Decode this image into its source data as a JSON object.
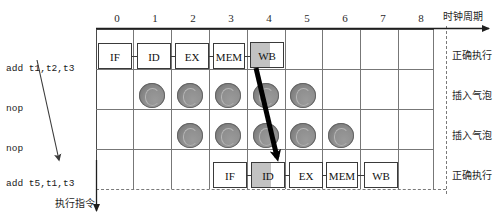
{
  "diagram": {
    "title_axis": "时钟周期",
    "bottom_axis": "执行指令",
    "cycles": [
      "0",
      "1",
      "2",
      "3",
      "4",
      "5",
      "6",
      "7",
      "8"
    ],
    "rows": [
      {
        "instruction": "add t1,t2,t3",
        "status": "正确执行",
        "kind": "stages",
        "stages": [
          {
            "label": "IF",
            "cycle": 0,
            "highlight": false
          },
          {
            "label": "ID",
            "cycle": 1,
            "highlight": false
          },
          {
            "label": "EX",
            "cycle": 2,
            "highlight": false
          },
          {
            "label": "MEM",
            "cycle": 3,
            "highlight": false
          },
          {
            "label": "WB",
            "cycle": 4,
            "highlight": true
          }
        ],
        "bubble_cycles": []
      },
      {
        "instruction": "nop",
        "status": "插入气泡",
        "kind": "bubbles",
        "stages": [],
        "bubble_cycles": [
          1,
          2,
          3,
          4,
          5
        ]
      },
      {
        "instruction": "nop",
        "status": "插入气泡",
        "kind": "bubbles",
        "stages": [],
        "bubble_cycles": [
          2,
          3,
          4,
          5,
          6
        ]
      },
      {
        "instruction": "add t5,t1,t3",
        "status": "正确执行",
        "kind": "stages",
        "stages": [
          {
            "label": "IF",
            "cycle": 3,
            "highlight": false
          },
          {
            "label": "ID",
            "cycle": 4,
            "highlight": true
          },
          {
            "label": "EX",
            "cycle": 5,
            "highlight": false
          },
          {
            "label": "MEM",
            "cycle": 6,
            "highlight": false
          },
          {
            "label": "WB",
            "cycle": 7,
            "highlight": false
          }
        ],
        "bubble_cycles": []
      }
    ],
    "forward_arrow": {
      "name": "forwarding-arrow",
      "from": "WB of add t1,t2,t3 (cycle 4)",
      "to": "ID of add t5,t1,t3 (cycle 4)"
    },
    "dependency_arrow": {
      "name": "dependency-arrow",
      "from": "add t1,t2,t3",
      "to": "add t5,t1,t3"
    },
    "colors": {
      "highlight_fill": "#c2c2c2",
      "bubble_fill": "#8f8f8f",
      "grid_line": "#777777",
      "box_border": "#3a3a3a",
      "arrow_thick": "#000000",
      "arrow_thin": "#4a4a4a",
      "dashed_boundary": "#7a7a7a"
    }
  }
}
